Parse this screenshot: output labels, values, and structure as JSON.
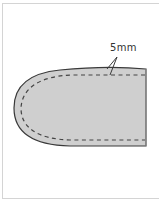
{
  "diagram": {
    "annotation": {
      "label": "5mm"
    },
    "colors": {
      "fill": "#cfcfcf",
      "outline": "#3a3a3a",
      "stitch": "#444444",
      "frame": "#d4d4d4",
      "background": "#ffffff"
    }
  }
}
